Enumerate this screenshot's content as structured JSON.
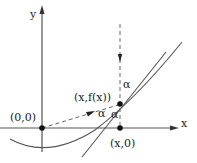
{
  "diagram": {
    "axes": {
      "x_label": "x",
      "y_label": "y"
    },
    "points": {
      "origin": "(0,0)",
      "curve_point": "(x,f(x))",
      "foot_point": "(x,0)"
    },
    "angles": {
      "alpha_top": "α",
      "alpha_left": "α",
      "alpha_bottom": "α"
    },
    "colors": {
      "line": "#555555",
      "dashed": "#666666",
      "dot": "#111111",
      "text": "#222222"
    }
  }
}
